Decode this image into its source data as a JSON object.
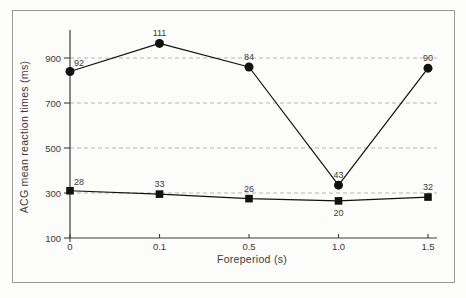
{
  "figure": {
    "background": "#fcfcfa",
    "frame_border_color": "#9a9a98",
    "axis_color": "#3d3d3d",
    "gridline_color": "#b5b5b3",
    "text_color": "#3a3a3a"
  },
  "chart_data": {
    "type": "line",
    "title": "",
    "xlabel": "Foreperiod (s)",
    "ylabel": "ACG mean reaction times (ms)",
    "categories": [
      "0",
      "0.1",
      "0.5",
      "1.0",
      "1.5"
    ],
    "yticks": [
      100,
      300,
      500,
      700,
      900
    ],
    "gridlines": [
      300,
      500,
      700,
      900
    ],
    "ylim": [
      100,
      1025
    ],
    "grid": "horizontal-dashed",
    "legend": "none",
    "series": [
      {
        "name": "filled-circle-series",
        "marker": "circle",
        "color": "#111111",
        "values": [
          840,
          965,
          860,
          335,
          855
        ],
        "point_labels": [
          "92",
          "111",
          "84",
          "43",
          "90"
        ],
        "label_positions": [
          "above-right",
          "above",
          "above",
          "above",
          "above"
        ]
      },
      {
        "name": "filled-square-series",
        "marker": "square",
        "color": "#111111",
        "values": [
          310,
          295,
          275,
          265,
          282
        ],
        "point_labels": [
          "28",
          "33",
          "26",
          "20",
          "32"
        ],
        "label_positions": [
          "above-right",
          "above",
          "above",
          "below",
          "above"
        ]
      }
    ]
  }
}
